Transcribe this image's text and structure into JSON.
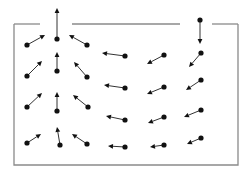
{
  "diagram": {
    "type": "vector-field",
    "colors": {
      "wall": "#8a8a8a",
      "arrow": "#333333",
      "dot": "#111111",
      "background": "#ffffff"
    },
    "container": {
      "top_y": 24,
      "bottom_y": 165,
      "left_x": 14,
      "right_x": 238,
      "top_segments": [
        [
          14,
          40
        ],
        [
          72,
          180
        ],
        [
          212,
          238
        ]
      ]
    },
    "vectors": [
      {
        "from": [
          27,
          45
        ],
        "to": [
          45,
          35
        ]
      },
      {
        "from": [
          57,
          39
        ],
        "to": [
          57,
          8
        ]
      },
      {
        "from": [
          87,
          45
        ],
        "to": [
          69,
          35
        ]
      },
      {
        "from": [
          27,
          76
        ],
        "to": [
          42,
          61
        ]
      },
      {
        "from": [
          57,
          71
        ],
        "to": [
          57,
          52
        ]
      },
      {
        "from": [
          87,
          77
        ],
        "to": [
          74,
          62
        ]
      },
      {
        "from": [
          27,
          107
        ],
        "to": [
          42,
          93
        ]
      },
      {
        "from": [
          57,
          111
        ],
        "to": [
          57,
          92
        ]
      },
      {
        "from": [
          88,
          107
        ],
        "to": [
          73,
          95
        ]
      },
      {
        "from": [
          27,
          143
        ],
        "to": [
          41,
          134
        ]
      },
      {
        "from": [
          60,
          145
        ],
        "to": [
          57,
          127
        ]
      },
      {
        "from": [
          87,
          144
        ],
        "to": [
          72,
          134
        ]
      },
      {
        "from": [
          125,
          56
        ],
        "to": [
          102,
          53
        ]
      },
      {
        "from": [
          125,
          88
        ],
        "to": [
          104,
          85
        ]
      },
      {
        "from": [
          125,
          120
        ],
        "to": [
          106,
          116
        ]
      },
      {
        "from": [
          125,
          147
        ],
        "to": [
          108,
          146
        ]
      },
      {
        "from": [
          164,
          55
        ],
        "to": [
          147,
          64
        ]
      },
      {
        "from": [
          164,
          87
        ],
        "to": [
          147,
          94
        ]
      },
      {
        "from": [
          164,
          117
        ],
        "to": [
          148,
          123
        ]
      },
      {
        "from": [
          164,
          145
        ],
        "to": [
          150,
          147
        ]
      },
      {
        "from": [
          200,
          20
        ],
        "to": [
          200,
          44
        ]
      },
      {
        "from": [
          201,
          53
        ],
        "to": [
          189,
          67
        ]
      },
      {
        "from": [
          201,
          80
        ],
        "to": [
          186,
          90
        ]
      },
      {
        "from": [
          201,
          110
        ],
        "to": [
          184,
          117
        ]
      },
      {
        "from": [
          201,
          138
        ],
        "to": [
          187,
          144
        ]
      }
    ]
  }
}
